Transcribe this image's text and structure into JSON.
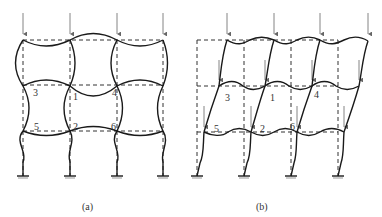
{
  "figures": [
    {
      "id": "a",
      "caption": "(a)",
      "description": "Symmetric buckling of multi-story frame (no sway)",
      "node_labels": [
        {
          "text": "3",
          "x": 33,
          "y": 96
        },
        {
          "text": "1",
          "x": 73,
          "y": 100
        },
        {
          "text": "4",
          "x": 112,
          "y": 96
        },
        {
          "text": "5",
          "x": 34,
          "y": 130
        },
        {
          "text": "2",
          "x": 73,
          "y": 130
        },
        {
          "text": "6",
          "x": 111,
          "y": 130
        }
      ]
    },
    {
      "id": "b",
      "caption": "(b)",
      "description": "Antisymmetric (sway) buckling of multi-story frame",
      "node_labels": [
        {
          "text": "3",
          "x": 225,
          "y": 101
        },
        {
          "text": "1",
          "x": 270,
          "y": 101
        },
        {
          "text": "4",
          "x": 314,
          "y": 98
        },
        {
          "text": "5",
          "x": 214,
          "y": 132
        },
        {
          "text": "2",
          "x": 260,
          "y": 132
        },
        {
          "text": "6",
          "x": 290,
          "y": 130
        }
      ]
    }
  ],
  "colors": {
    "line": "#1a1a1a",
    "dashed": "#333333",
    "arrow": "#666666",
    "background": "#ffffff"
  }
}
